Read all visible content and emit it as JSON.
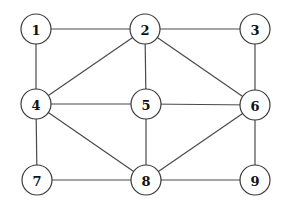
{
  "graph": {
    "node_radius": 15,
    "colors": {
      "edge": "#4a4a4a",
      "node_stroke": "#3a3a3a",
      "node_fill": "#ffffff",
      "label": "#111111",
      "background": "#ffffff"
    },
    "nodes": [
      {
        "id": "1",
        "label": "1",
        "x": 36,
        "y": 29
      },
      {
        "id": "2",
        "label": "2",
        "x": 145,
        "y": 29
      },
      {
        "id": "3",
        "label": "3",
        "x": 255,
        "y": 29
      },
      {
        "id": "4",
        "label": "4",
        "x": 36,
        "y": 104
      },
      {
        "id": "5",
        "label": "5",
        "x": 146,
        "y": 104
      },
      {
        "id": "6",
        "label": "6",
        "x": 255,
        "y": 105
      },
      {
        "id": "7",
        "label": "7",
        "x": 37,
        "y": 180
      },
      {
        "id": "8",
        "label": "8",
        "x": 146,
        "y": 180
      },
      {
        "id": "9",
        "label": "9",
        "x": 255,
        "y": 180
      }
    ],
    "edges": [
      {
        "from": "1",
        "to": "2"
      },
      {
        "from": "1",
        "to": "4"
      },
      {
        "from": "2",
        "to": "3"
      },
      {
        "from": "2",
        "to": "4"
      },
      {
        "from": "2",
        "to": "5"
      },
      {
        "from": "2",
        "to": "6"
      },
      {
        "from": "3",
        "to": "6"
      },
      {
        "from": "4",
        "to": "5"
      },
      {
        "from": "4",
        "to": "7"
      },
      {
        "from": "4",
        "to": "8"
      },
      {
        "from": "5",
        "to": "6"
      },
      {
        "from": "5",
        "to": "8"
      },
      {
        "from": "6",
        "to": "8"
      },
      {
        "from": "6",
        "to": "9"
      },
      {
        "from": "7",
        "to": "8"
      },
      {
        "from": "8",
        "to": "9"
      }
    ]
  }
}
